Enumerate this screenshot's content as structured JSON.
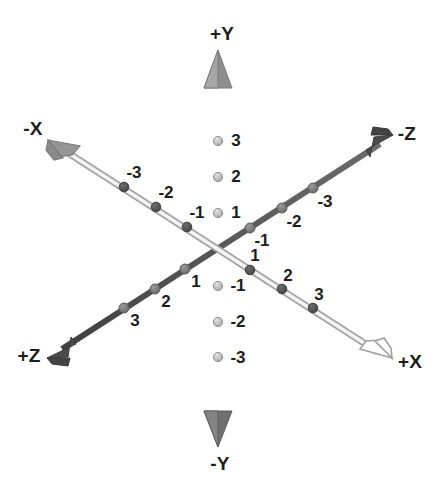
{
  "figure": {
    "background_color": "#ffffff",
    "origin": {
      "x": 218,
      "y": 249
    }
  },
  "colors": {
    "y_axis": "#8a8a8a",
    "y_axis_highlight": "#b5b5b5",
    "y_tick_dot": "#c0c0c0",
    "y_tick_dot_stroke": "#8f8f8f",
    "z_axis": "#4f4f4f",
    "z_tick_dot": "#7b7b7b",
    "x_axis_stroke": "#a9a9a9",
    "x_axis_fill": "#f2f2f2",
    "x_tick_dot": "#5a5a5a",
    "x_pos_arrow_fill": "#ffffff",
    "x_neg_arrow_fill": "#949494",
    "text": "#1d1d1d"
  },
  "axes": [
    {
      "name": "y-axis",
      "orientation": "vertical",
      "style": "solid-gray",
      "positive_label": "+Y",
      "negative_label": "-Y",
      "positive_label_pos": {
        "x": 222,
        "y": 33
      },
      "negative_label_pos": {
        "x": 220,
        "y": 463
      },
      "positive_tip": {
        "x": 218,
        "y": 50
      },
      "negative_tip": {
        "x": 218,
        "y": 447
      },
      "ticks": [
        {
          "value": "3",
          "dot": {
            "x": 218,
            "y": 141
          },
          "label_pos": {
            "x": 236,
            "y": 140
          }
        },
        {
          "value": "2",
          "dot": {
            "x": 218,
            "y": 177
          },
          "label_pos": {
            "x": 236,
            "y": 176
          }
        },
        {
          "value": "1",
          "dot": {
            "x": 218,
            "y": 213
          },
          "label_pos": {
            "x": 236,
            "y": 212
          }
        },
        {
          "value": "-1",
          "dot": {
            "x": 218,
            "y": 286
          },
          "label_pos": {
            "x": 238,
            "y": 285
          }
        },
        {
          "value": "-2",
          "dot": {
            "x": 218,
            "y": 322
          },
          "label_pos": {
            "x": 238,
            "y": 321
          }
        },
        {
          "value": "-3",
          "dot": {
            "x": 218,
            "y": 357
          },
          "label_pos": {
            "x": 238,
            "y": 357
          }
        }
      ]
    },
    {
      "name": "x-axis",
      "orientation": "diagonal-upper-left-to-lower-right",
      "style": "hollow-outline",
      "positive_label": "+X",
      "negative_label": "-X",
      "positive_label_pos": {
        "x": 410,
        "y": 361
      },
      "negative_label_pos": {
        "x": 33,
        "y": 128
      },
      "positive_tip": {
        "x": 392,
        "y": 358
      },
      "negative_tip": {
        "x": 48,
        "y": 140
      },
      "ticks": [
        {
          "value": "-3",
          "dot": {
            "x": 124,
            "y": 187
          },
          "label_pos": {
            "x": 134,
            "y": 172
          }
        },
        {
          "value": "-2",
          "dot": {
            "x": 156,
            "y": 207
          },
          "label_pos": {
            "x": 166,
            "y": 192
          }
        },
        {
          "value": "-1",
          "dot": {
            "x": 187,
            "y": 227
          },
          "label_pos": {
            "x": 197,
            "y": 212
          }
        },
        {
          "value": "1",
          "dot": {
            "x": 250,
            "y": 270
          },
          "label_pos": {
            "x": 255,
            "y": 255
          }
        },
        {
          "value": "2",
          "dot": {
            "x": 282,
            "y": 289
          },
          "label_pos": {
            "x": 288,
            "y": 275
          }
        },
        {
          "value": "3",
          "dot": {
            "x": 313,
            "y": 308
          },
          "label_pos": {
            "x": 319,
            "y": 294
          }
        }
      ]
    },
    {
      "name": "z-axis",
      "orientation": "diagonal-lower-left-to-upper-right",
      "style": "solid-dark",
      "positive_label": "+Z",
      "negative_label": "-Z",
      "positive_label_pos": {
        "x": 29,
        "y": 355
      },
      "negative_label_pos": {
        "x": 407,
        "y": 133
      },
      "positive_tip": {
        "x": 47,
        "y": 358
      },
      "negative_tip": {
        "x": 393,
        "y": 135
      },
      "ticks": [
        {
          "value": "-1",
          "dot": {
            "x": 250,
            "y": 228
          },
          "label_pos": {
            "x": 262,
            "y": 240
          }
        },
        {
          "value": "-2",
          "dot": {
            "x": 282,
            "y": 208
          },
          "label_pos": {
            "x": 294,
            "y": 221
          }
        },
        {
          "value": "-3",
          "dot": {
            "x": 313,
            "y": 188
          },
          "label_pos": {
            "x": 325,
            "y": 201
          }
        },
        {
          "value": "1",
          "dot": {
            "x": 185,
            "y": 269
          },
          "label_pos": {
            "x": 196,
            "y": 281
          }
        },
        {
          "value": "2",
          "dot": {
            "x": 155,
            "y": 289
          },
          "label_pos": {
            "x": 166,
            "y": 301
          }
        },
        {
          "value": "3",
          "dot": {
            "x": 124,
            "y": 308
          },
          "label_pos": {
            "x": 135,
            "y": 320
          }
        }
      ]
    }
  ]
}
